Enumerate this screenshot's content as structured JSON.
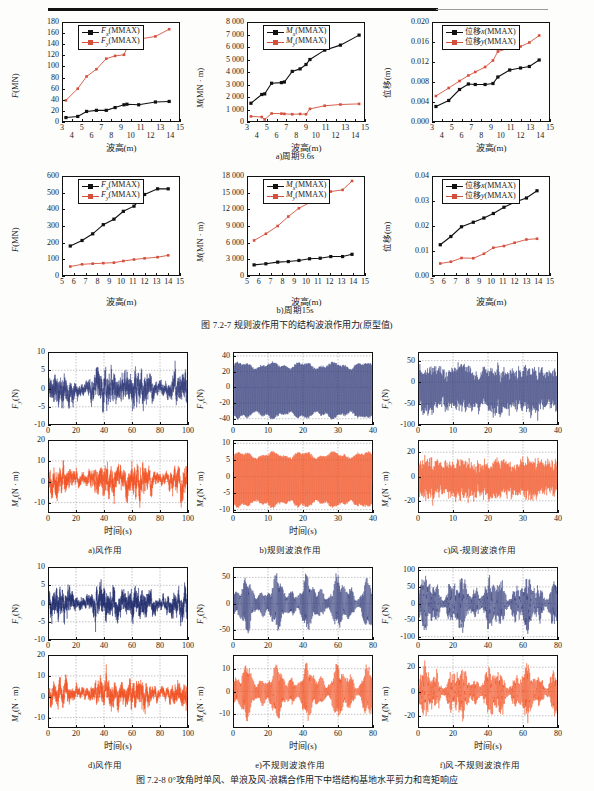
{
  "figure_7_2_7": {
    "caption": "图 7.2-7   规则波作用下的结构波浪作用力(原型值)",
    "subcaptions": {
      "a": "a)周期9.6s",
      "b": "b)周期15s"
    },
    "charts": [
      {
        "id": "f-96",
        "ylabel_html": "F(MN)",
        "xlabel": "波高(m)",
        "legend": [
          "Fx(MMAX)",
          "Fy(MMAX)"
        ],
        "yticks": [
          "0",
          "20",
          "40",
          "60",
          "80",
          "100",
          "120",
          "140",
          "160",
          "180"
        ],
        "xticks": [
          "3",
          "4",
          "5",
          "6",
          "7",
          "8",
          "9",
          "10",
          "11",
          "12",
          "13",
          "14",
          "15"
        ]
      },
      {
        "id": "m-96",
        "ylabel_html": "M(MN · m)",
        "xlabel": "波高(m)",
        "legend": [
          "Mx(MMAX)",
          "My(MMAX)"
        ],
        "yticks": [
          "0",
          "1 000",
          "2 000",
          "3 000",
          "4 000",
          "5 000",
          "6 000",
          "7 000",
          "8 000"
        ],
        "xticks": [
          "3",
          "4",
          "5",
          "6",
          "7",
          "8",
          "9",
          "10",
          "11",
          "12",
          "13",
          "14",
          "15"
        ]
      },
      {
        "id": "d-96",
        "ylabel_html": "位移(m)",
        "xlabel": "波高(m)",
        "legend": [
          "位移x(MMAX)",
          "位移y(MMAX)"
        ],
        "yticks": [
          "0.000",
          "0.004",
          "0.008",
          "0.012",
          "0.016",
          "0.020"
        ],
        "xticks": [
          "3",
          "4",
          "5",
          "6",
          "7",
          "8",
          "9",
          "10",
          "11",
          "12",
          "13",
          "14",
          "15"
        ]
      },
      {
        "id": "f-15",
        "ylabel_html": "F(MN)",
        "xlabel": "波高(m)",
        "legend": [
          "Fx(MMAX)",
          "Fy(MMAX)"
        ],
        "yticks": [
          "0",
          "100",
          "200",
          "300",
          "400",
          "500",
          "600"
        ],
        "xticks": [
          "5",
          "6",
          "7",
          "8",
          "9",
          "10",
          "11",
          "12",
          "13",
          "14",
          "15"
        ]
      },
      {
        "id": "m-15",
        "ylabel_html": "M(MN · m)",
        "xlabel": "波高(m)",
        "legend": [
          "Mx(MMAX)",
          "My(MMAX)"
        ],
        "yticks": [
          "0",
          "3 000",
          "6 000",
          "9 000",
          "12 000",
          "15 000",
          "18 000"
        ],
        "xticks": [
          "5",
          "6",
          "7",
          "8",
          "9",
          "10",
          "11",
          "12",
          "13",
          "14",
          "15"
        ]
      },
      {
        "id": "d-15",
        "ylabel_html": "位移(m)",
        "xlabel": "波高(m)",
        "legend": [
          "位移x(MMAX)",
          "位移y(MMAX)"
        ],
        "yticks": [
          "0.00",
          "0.01",
          "0.02",
          "0.03",
          "0.04"
        ],
        "xticks": [
          "5",
          "6",
          "7",
          "8",
          "9",
          "10",
          "11",
          "12",
          "13",
          "14",
          "15"
        ]
      }
    ]
  },
  "figure_7_2_8": {
    "caption": "图 7.2-8   0°攻角时单风、单浪及风-浪耦合作用下中塔结构基地水平剪力和弯矩响应",
    "subcaptions": {
      "a": "a)风作用",
      "b": "b)规则波浪作用",
      "c": "c)风-规则波浪作用",
      "d": "d)风作用",
      "e": "e)不规则波浪作用",
      "f": "f)风-不规则波浪作用"
    },
    "xlabel": "时间(s)",
    "panels": [
      {
        "id": "a-fy",
        "ylabel": "Fy(N)",
        "yticks": [
          "-10",
          "-5",
          "0",
          "5",
          "10"
        ],
        "xticks": [
          "0",
          "20",
          "40",
          "60",
          "80",
          "100"
        ]
      },
      {
        "id": "a-mx",
        "ylabel": "Mx(N · m)",
        "yticks": [
          "-10",
          "0",
          "10",
          "20"
        ],
        "xticks": [
          "0",
          "20",
          "40",
          "60",
          "80",
          "100"
        ]
      },
      {
        "id": "b-fy",
        "ylabel": "Fy(N)",
        "yticks": [
          "-40",
          "-20",
          "0",
          "20",
          "40"
        ],
        "xticks": [
          "0",
          "10",
          "20",
          "30",
          "40"
        ]
      },
      {
        "id": "b-mx",
        "ylabel": "Mx(N · m)",
        "yticks": [
          "-10",
          "-5",
          "0",
          "5",
          "10"
        ],
        "xticks": [
          "0",
          "10",
          "20",
          "30",
          "40"
        ]
      },
      {
        "id": "c-fy",
        "ylabel": "Fy(N)",
        "yticks": [
          "-100",
          "-50",
          "0",
          "50"
        ],
        "xticks": [
          "0",
          "10",
          "20",
          "30",
          "40"
        ]
      },
      {
        "id": "c-mx",
        "ylabel": "Mx(N · m)",
        "yticks": [
          "-20",
          "0",
          "20"
        ],
        "xticks": [
          "0",
          "10",
          "20",
          "30",
          "40"
        ]
      },
      {
        "id": "d-fy",
        "ylabel": "Fy(N)",
        "yticks": [
          "-10",
          "-5",
          "0",
          "5",
          "10"
        ],
        "xticks": [
          "0",
          "20",
          "40",
          "60",
          "80",
          "100"
        ]
      },
      {
        "id": "d-mx",
        "ylabel": "Mx(N · m)",
        "yticks": [
          "-10",
          "0",
          "10",
          "20"
        ],
        "xticks": [
          "0",
          "20",
          "40",
          "60",
          "80",
          "100"
        ]
      },
      {
        "id": "e-fy",
        "ylabel": "Fy(N)",
        "yticks": [
          "-50",
          "0",
          "50"
        ],
        "xticks": [
          "0",
          "20",
          "40",
          "60",
          "80"
        ]
      },
      {
        "id": "e-mx",
        "ylabel": "Mx(N · m)",
        "yticks": [
          "-10",
          "0",
          "10"
        ],
        "xticks": [
          "0",
          "20",
          "40",
          "60",
          "80"
        ]
      },
      {
        "id": "f-fy",
        "ylabel": "Fy(N)",
        "yticks": [
          "-100",
          "-50",
          "0",
          "50",
          "100"
        ],
        "xticks": [
          "0",
          "20",
          "40",
          "60",
          "80"
        ]
      },
      {
        "id": "f-mx",
        "ylabel": "Mx(N · m)",
        "yticks": [
          "-20",
          "0",
          "20"
        ],
        "xticks": [
          "0",
          "20",
          "40",
          "60",
          "80"
        ]
      }
    ]
  },
  "colors": {
    "series_x": "#111111",
    "series_y": "#d4503c",
    "trace_blue": "#2f3a78",
    "trace_orange": "#f04e1e",
    "axis": "#111111",
    "grid": "#777777"
  },
  "chart_data": [
    {
      "type": "line",
      "id": "f-96",
      "title": "",
      "xlabel": "波高(m)",
      "ylabel": "F(MN)",
      "xlim": [
        3,
        15
      ],
      "ylim": [
        0,
        180
      ],
      "grid": false,
      "legend_position": "top-left",
      "x": [
        3.4,
        4.6,
        5.5,
        6.5,
        7.5,
        8.4,
        9.3,
        9.6,
        10.8,
        12.5,
        13.9
      ],
      "series": [
        {
          "name": "Fx(MMAX)",
          "color": "#111111",
          "values": [
            8,
            10,
            19,
            21,
            21,
            26,
            31,
            32,
            31,
            36,
            37
          ]
        },
        {
          "name": "Fy(MMAX)",
          "color": "#d4503c",
          "values": [
            39,
            60,
            82,
            95,
            114,
            119,
            121,
            133,
            149,
            154,
            167
          ]
        }
      ]
    },
    {
      "type": "line",
      "id": "m-96",
      "xlabel": "波高(m)",
      "ylabel": "M(MN · m)",
      "xlim": [
        3,
        15
      ],
      "ylim": [
        0,
        8000
      ],
      "grid": false,
      "legend_position": "top-left",
      "x": [
        3.4,
        4.5,
        4.8,
        5.5,
        6.5,
        6.8,
        7.6,
        8.4,
        9.0,
        9.4,
        10.9,
        12.5,
        14.4
      ],
      "series": [
        {
          "name": "Mx(MMAX)",
          "color": "#111111",
          "values": [
            1500,
            2200,
            2250,
            3100,
            3150,
            3200,
            4050,
            4250,
            4600,
            5000,
            5750,
            6150,
            6950
          ]
        },
        {
          "name": "My(MMAX)",
          "color": "#d4503c",
          "values": [
            450,
            400,
            200,
            680,
            670,
            650,
            620,
            640,
            620,
            1050,
            1300,
            1400,
            1450
          ]
        }
      ]
    },
    {
      "type": "line",
      "id": "d-96",
      "xlabel": "波高(m)",
      "ylabel": "位移(m)",
      "xlim": [
        3,
        15
      ],
      "ylim": [
        0.0,
        0.02
      ],
      "grid": false,
      "legend_position": "top-left",
      "x": [
        3.4,
        4.7,
        5.8,
        6.7,
        7.4,
        8.4,
        9.2,
        9.7,
        10.9,
        12.0,
        12.9,
        13.9
      ],
      "series": [
        {
          "name": "位移x(MMAX)",
          "color": "#111111",
          "values": [
            0.0031,
            0.0043,
            0.0065,
            0.0076,
            0.0075,
            0.0075,
            0.0077,
            0.009,
            0.0104,
            0.0108,
            0.0111,
            0.0124
          ]
        },
        {
          "name": "位移y(MMAX)",
          "color": "#d4503c",
          "values": [
            0.0052,
            0.0068,
            0.0082,
            0.0093,
            0.01,
            0.011,
            0.0123,
            0.0141,
            0.0148,
            0.0151,
            0.0159,
            0.0173
          ]
        }
      ]
    },
    {
      "type": "line",
      "id": "f-15",
      "xlabel": "波高(m)",
      "ylabel": "F(MN)",
      "xlim": [
        5,
        15
      ],
      "ylim": [
        0,
        600
      ],
      "grid": false,
      "legend_position": "top-left",
      "x": [
        5.7,
        6.7,
        7.6,
        8.5,
        9.4,
        10.2,
        11.1,
        12.0,
        13.1,
        14.0
      ],
      "series": [
        {
          "name": "Fx(MMAX)",
          "color": "#111111",
          "values": [
            180,
            213,
            253,
            308,
            341,
            388,
            419,
            489,
            523,
            523
          ]
        },
        {
          "name": "Fy(MMAX)",
          "color": "#d4503c",
          "values": [
            57,
            70,
            74,
            77,
            80,
            90,
            99,
            106,
            113,
            124
          ]
        }
      ]
    },
    {
      "type": "line",
      "id": "m-15",
      "xlabel": "波高(m)",
      "ylabel": "M(MN · m)",
      "xlim": [
        5,
        15
      ],
      "ylim": [
        0,
        18000
      ],
      "grid": false,
      "legend_position": "top-left",
      "x": [
        5.6,
        6.6,
        7.6,
        8.5,
        9.4,
        10.3,
        11.2,
        12.1,
        13.1,
        13.9
      ],
      "series": [
        {
          "name": "Mx(MMAX)",
          "color": "#111111",
          "values": [
            2000,
            2200,
            2500,
            2600,
            2800,
            3100,
            3200,
            3500,
            3500,
            3900
          ]
        },
        {
          "name": "My(MMAX)",
          "color": "#d4503c",
          "values": [
            6400,
            7600,
            9000,
            10700,
            12200,
            13200,
            13900,
            15200,
            15500,
            17100
          ]
        }
      ]
    },
    {
      "type": "line",
      "id": "d-15",
      "xlabel": "波高(m)",
      "ylabel": "位移(m)",
      "xlim": [
        5,
        15
      ],
      "ylim": [
        0.0,
        0.04
      ],
      "grid": false,
      "legend_position": "top-left",
      "x": [
        5.7,
        6.6,
        7.5,
        8.5,
        9.4,
        10.2,
        11.1,
        12.0,
        13.0,
        13.9
      ],
      "series": [
        {
          "name": "位移x(MMAX)",
          "color": "#111111",
          "values": [
            0.0125,
            0.0158,
            0.0197,
            0.0215,
            0.0232,
            0.025,
            0.0275,
            0.0295,
            0.0312,
            0.0341
          ]
        },
        {
          "name": "位移y(MMAX)",
          "color": "#d4503c",
          "values": [
            0.005,
            0.0057,
            0.0072,
            0.0071,
            0.0089,
            0.0113,
            0.012,
            0.0133,
            0.0146,
            0.0149
          ]
        }
      ]
    },
    {
      "type": "line",
      "id": "timeseries-group",
      "description": "12 dense oscillating time-history traces (base shear Fy and overturning moment Mx) under wind, regular wave, wind-regular wave, irregular wave and wind-irregular wave loading",
      "xlabel": "时间(s)",
      "panels": [
        {
          "id": "a-fy",
          "ylabel": "Fy(N)",
          "xlim": [
            0,
            110
          ],
          "ylim": [
            -10,
            10
          ],
          "signal": "narrowband random, amplitude ~7"
        },
        {
          "id": "a-mx",
          "ylabel": "Mx(N · m)",
          "xlim": [
            0,
            110
          ],
          "ylim": [
            -15,
            20
          ],
          "signal": "narrowband random, amplitude ~13"
        },
        {
          "id": "b-fy",
          "ylabel": "Fy(N)",
          "xlim": [
            0,
            40
          ],
          "ylim": [
            -48,
            45
          ],
          "signal": "periodic regular, amplitude ~38"
        },
        {
          "id": "b-mx",
          "ylabel": "Mx(N · m)",
          "xlim": [
            0,
            40
          ],
          "ylim": [
            -11,
            11
          ],
          "signal": "periodic regular, amplitude ~9"
        },
        {
          "id": "c-fy",
          "ylabel": "Fy(N)",
          "xlim": [
            0,
            40
          ],
          "ylim": [
            -100,
            70
          ],
          "signal": "periodic regular + wind, amplitude ~80"
        },
        {
          "id": "c-mx",
          "ylabel": "Mx(N · m)",
          "xlim": [
            0,
            40
          ],
          "ylim": [
            -30,
            30
          ],
          "signal": "periodic regular + wind, amplitude ~24"
        },
        {
          "id": "d-fy",
          "ylabel": "Fy(N)",
          "xlim": [
            0,
            110
          ],
          "ylim": [
            -10,
            10
          ],
          "signal": "narrowband random, amplitude ~7"
        },
        {
          "id": "d-mx",
          "ylabel": "Mx(N · m)",
          "xlim": [
            0,
            110
          ],
          "ylim": [
            -15,
            20
          ],
          "signal": "narrowband random, amplitude ~13"
        },
        {
          "id": "e-fy",
          "ylabel": "Fy(N)",
          "xlim": [
            0,
            80
          ],
          "ylim": [
            -70,
            70
          ],
          "signal": "irregular grouped bursts, peak ~60"
        },
        {
          "id": "e-mx",
          "ylabel": "Mx(N · m)",
          "xlim": [
            0,
            80
          ],
          "ylim": [
            -16,
            16
          ],
          "signal": "irregular grouped bursts, peak ~14"
        },
        {
          "id": "f-fy",
          "ylabel": "Fy(N)",
          "xlim": [
            0,
            80
          ],
          "ylim": [
            -110,
            110
          ],
          "signal": "irregular + wind, peak ~95"
        },
        {
          "id": "f-mx",
          "ylabel": "Mx(N · m)",
          "xlim": [
            0,
            80
          ],
          "ylim": [
            -30,
            30
          ],
          "signal": "irregular + wind, peak ~26"
        }
      ]
    }
  ]
}
